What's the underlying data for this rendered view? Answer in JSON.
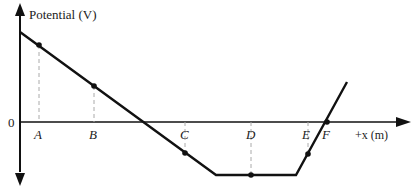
{
  "diagram": {
    "y_axis_label": "Potential (V)",
    "x_axis_label": "+x (m)",
    "origin_label": "0",
    "points": [
      {
        "label": "A",
        "x": 39,
        "y": 45
      },
      {
        "label": "B",
        "x": 94,
        "y": 86
      },
      {
        "label": "C",
        "x": 185,
        "y": 153
      },
      {
        "label": "D",
        "x": 251,
        "y": 175
      },
      {
        "label": "E",
        "x": 308,
        "y": 154
      },
      {
        "label": "F",
        "x": 327,
        "y": 122
      }
    ],
    "labels": {
      "A": "A",
      "B": "B",
      "C": "C",
      "D": "D",
      "E": "E",
      "F": "F"
    },
    "colors": {
      "line": "#111111",
      "axis": "#111111",
      "dash": "#aaaaaa"
    }
  }
}
